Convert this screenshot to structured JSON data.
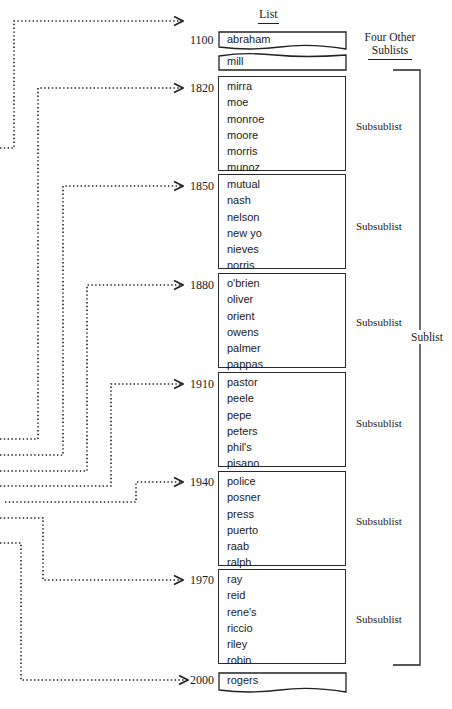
{
  "title": "List",
  "other_sublists_label": [
    "Four Other",
    "Sublists"
  ],
  "sublist_label": "Sublist",
  "subsublist_label": "Subsublist",
  "head_entry": {
    "key": "1100",
    "items": [
      "abraham"
    ]
  },
  "gap_entry": {
    "items": [
      "mill"
    ]
  },
  "subsublists": [
    {
      "key": "1820",
      "items": [
        "mirra",
        "moe",
        "monroe",
        "moore",
        "morris",
        "munoz"
      ]
    },
    {
      "key": "1850",
      "items": [
        "mutual",
        "nash",
        "nelson",
        "new yo",
        "nieves",
        "norris"
      ]
    },
    {
      "key": "1880",
      "items": [
        "o'brien",
        "oliver",
        "orient",
        "owens",
        "palmer",
        "pappas"
      ]
    },
    {
      "key": "1910",
      "items": [
        "pastor",
        "peele",
        "pepe",
        "peters",
        "phil's",
        "pisano"
      ]
    },
    {
      "key": "1940",
      "items": [
        "police",
        "posner",
        "press",
        "puerto",
        "raab",
        "ralph"
      ]
    },
    {
      "key": "1970",
      "items": [
        "ray",
        "reid",
        "rene's",
        "riccio",
        "riley",
        "robin"
      ]
    }
  ],
  "tail_entry": {
    "key": "2000",
    "items": [
      "rogers"
    ]
  }
}
